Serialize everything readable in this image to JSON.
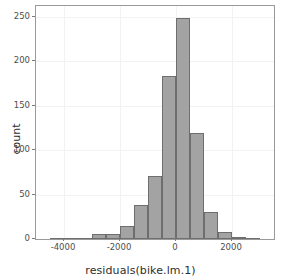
{
  "chart_data": {
    "type": "bar",
    "title": "",
    "subtitle": "",
    "xlabel": "residuals(bike.lm.1)",
    "ylabel": "count",
    "binwidth": 500,
    "xlim": [
      -5000,
      3500
    ],
    "ylim": [
      0,
      262
    ],
    "grid": true,
    "legend": null,
    "annotations": [],
    "x_ticks": [
      {
        "value": -4000,
        "label": "-4000"
      },
      {
        "value": -2000,
        "label": "-2000"
      },
      {
        "value": 0,
        "label": "0"
      },
      {
        "value": 2000,
        "label": "2000"
      }
    ],
    "y_ticks": [
      {
        "value": 0,
        "label": "0"
      },
      {
        "value": 50,
        "label": "50"
      },
      {
        "value": 100,
        "label": "100"
      },
      {
        "value": 150,
        "label": "150"
      },
      {
        "value": 200,
        "label": "200"
      },
      {
        "value": 250,
        "label": "250"
      }
    ],
    "bins": [
      {
        "x0": -4500,
        "x1": -4000,
        "center": -4250,
        "value": 1
      },
      {
        "x0": -4000,
        "x1": -3500,
        "center": -3750,
        "value": 1
      },
      {
        "x0": -3500,
        "x1": -3000,
        "center": -3250,
        "value": 1
      },
      {
        "x0": -3000,
        "x1": -2500,
        "center": -2750,
        "value": 6
      },
      {
        "x0": -2500,
        "x1": -2000,
        "center": -2250,
        "value": 6
      },
      {
        "x0": -2000,
        "x1": -1500,
        "center": -1750,
        "value": 15
      },
      {
        "x0": -1500,
        "x1": -1000,
        "center": -1250,
        "value": 38
      },
      {
        "x0": -1000,
        "x1": -500,
        "center": -750,
        "value": 71
      },
      {
        "x0": -500,
        "x1": 0,
        "center": -250,
        "value": 183
      },
      {
        "x0": 0,
        "x1": 500,
        "center": 250,
        "value": 249
      },
      {
        "x0": 500,
        "x1": 1000,
        "center": 750,
        "value": 119
      },
      {
        "x0": 1000,
        "x1": 1500,
        "center": 1250,
        "value": 30
      },
      {
        "x0": 1500,
        "x1": 2000,
        "center": 1750,
        "value": 8
      },
      {
        "x0": 2000,
        "x1": 2500,
        "center": 2250,
        "value": 2
      },
      {
        "x0": 2500,
        "x1": 3000,
        "center": 2750,
        "value": 1
      }
    ],
    "categories": [
      "-4250",
      "-3750",
      "-3250",
      "-2750",
      "-2250",
      "-1750",
      "-1250",
      "-750",
      "-250",
      "250",
      "750",
      "1250",
      "1750",
      "2250",
      "2750"
    ],
    "values": [
      1,
      1,
      1,
      6,
      6,
      15,
      38,
      71,
      183,
      249,
      119,
      30,
      8,
      2,
      1
    ],
    "style": {
      "bar_fill": "#a3a3a3",
      "bar_stroke": "#6e6e6e",
      "panel_background": "#ffffff",
      "panel_border": "#9a9a9a",
      "grid_color": "#f2f2f2",
      "text_color": "#2e2e2e",
      "tick_label_color": "#4d4d4d"
    }
  }
}
